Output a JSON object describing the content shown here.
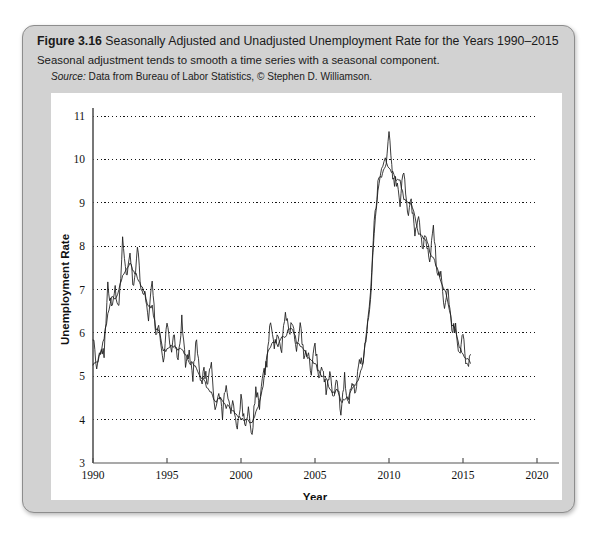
{
  "figure": {
    "label": "Figure 3.16",
    "title": "Seasonally Adjusted and Unadjusted Unemployment Rate for the Years 1990–2015",
    "subtitle": "Seasonal adjustment tends to smooth a time series with a seasonal component.",
    "source_label": "Source:",
    "source_text": "Data from Bureau of Labor Statistics, © Stephen D. Williamson."
  },
  "chart_data": {
    "type": "line",
    "title": "",
    "xlabel": "Year",
    "ylabel": "Unemployment Rate",
    "xlim": [
      1990,
      2020
    ],
    "ylim": [
      3,
      11
    ],
    "xticks": [
      1990,
      1995,
      2000,
      2005,
      2010,
      2015,
      2020
    ],
    "yticks": [
      3,
      4,
      5,
      6,
      7,
      8,
      9,
      10,
      11
    ],
    "grid": "horizontal-dotted",
    "legend": "none",
    "line_color": "#1a1a1a",
    "series": [
      {
        "name": "Seasonally Adjusted",
        "style": "smooth",
        "x": [
          1990.0,
          1990.25,
          1990.5,
          1990.75,
          1991.0,
          1991.25,
          1991.5,
          1991.75,
          1992.0,
          1992.25,
          1992.5,
          1992.75,
          1993.0,
          1993.25,
          1993.5,
          1993.75,
          1994.0,
          1994.25,
          1994.5,
          1994.75,
          1995.0,
          1995.25,
          1995.5,
          1995.75,
          1996.0,
          1996.25,
          1996.5,
          1996.75,
          1997.0,
          1997.25,
          1997.5,
          1997.75,
          1998.0,
          1998.25,
          1998.5,
          1998.75,
          1999.0,
          1999.25,
          1999.5,
          1999.75,
          2000.0,
          2000.25,
          2000.5,
          2000.75,
          2001.0,
          2001.25,
          2001.5,
          2001.75,
          2002.0,
          2002.25,
          2002.5,
          2002.75,
          2003.0,
          2003.25,
          2003.5,
          2003.75,
          2004.0,
          2004.25,
          2004.5,
          2004.75,
          2005.0,
          2005.25,
          2005.5,
          2005.75,
          2006.0,
          2006.25,
          2006.5,
          2006.75,
          2007.0,
          2007.25,
          2007.5,
          2007.75,
          2008.0,
          2008.25,
          2008.5,
          2008.75,
          2009.0,
          2009.25,
          2009.5,
          2009.75,
          2010.0,
          2010.25,
          2010.5,
          2010.75,
          2011.0,
          2011.25,
          2011.5,
          2011.75,
          2012.0,
          2012.25,
          2012.5,
          2012.75,
          2013.0,
          2013.25,
          2013.5,
          2013.75,
          2014.0,
          2014.25,
          2014.5,
          2014.75,
          2015.0,
          2015.25,
          2015.5
        ],
        "y": [
          5.3,
          5.3,
          5.5,
          5.9,
          6.4,
          6.8,
          6.8,
          7.0,
          7.3,
          7.5,
          7.6,
          7.4,
          7.3,
          7.1,
          6.9,
          6.6,
          6.6,
          6.1,
          6.0,
          5.6,
          5.6,
          5.7,
          5.7,
          5.6,
          5.6,
          5.5,
          5.3,
          5.3,
          5.2,
          5.0,
          4.9,
          4.7,
          4.6,
          4.4,
          4.5,
          4.4,
          4.3,
          4.3,
          4.2,
          4.1,
          4.0,
          4.0,
          4.0,
          3.9,
          4.2,
          4.4,
          4.8,
          5.5,
          5.7,
          5.8,
          5.7,
          5.9,
          5.9,
          6.1,
          6.1,
          5.8,
          5.7,
          5.6,
          5.4,
          5.4,
          5.3,
          5.1,
          5.0,
          5.0,
          4.7,
          4.6,
          4.7,
          4.4,
          4.5,
          4.5,
          4.7,
          4.8,
          5.0,
          5.3,
          6.1,
          6.9,
          8.3,
          9.3,
          9.8,
          10.0,
          9.8,
          9.7,
          9.5,
          9.5,
          9.1,
          9.0,
          9.0,
          8.7,
          8.3,
          8.2,
          8.2,
          7.9,
          7.7,
          7.5,
          7.2,
          7.0,
          6.7,
          6.2,
          6.1,
          5.7,
          5.5,
          5.4,
          5.3
        ]
      },
      {
        "name": "Unadjusted",
        "style": "jagged-seasonal",
        "x": [
          1990.0,
          1990.25,
          1990.5,
          1990.75,
          1991.0,
          1991.25,
          1991.5,
          1991.75,
          1992.0,
          1992.25,
          1992.5,
          1992.75,
          1993.0,
          1993.25,
          1993.5,
          1993.75,
          1994.0,
          1994.25,
          1994.5,
          1994.75,
          1995.0,
          1995.25,
          1995.5,
          1995.75,
          1996.0,
          1996.25,
          1996.5,
          1996.75,
          1997.0,
          1997.25,
          1997.5,
          1997.75,
          1998.0,
          1998.25,
          1998.5,
          1998.75,
          1999.0,
          1999.25,
          1999.5,
          1999.75,
          2000.0,
          2000.25,
          2000.5,
          2000.75,
          2001.0,
          2001.25,
          2001.5,
          2001.75,
          2002.0,
          2002.25,
          2002.5,
          2002.75,
          2003.0,
          2003.25,
          2003.5,
          2003.75,
          2004.0,
          2004.25,
          2004.5,
          2004.75,
          2005.0,
          2005.25,
          2005.5,
          2005.75,
          2006.0,
          2006.25,
          2006.5,
          2006.75,
          2007.0,
          2007.25,
          2007.5,
          2007.75,
          2008.0,
          2008.25,
          2008.5,
          2008.75,
          2009.0,
          2009.25,
          2009.5,
          2009.75,
          2010.0,
          2010.25,
          2010.5,
          2010.75,
          2011.0,
          2011.25,
          2011.5,
          2011.75,
          2012.0,
          2012.25,
          2012.5,
          2012.75,
          2013.0,
          2013.25,
          2013.5,
          2013.75,
          2014.0,
          2014.25,
          2014.5,
          2014.75,
          2015.0,
          2015.25,
          2015.5
        ],
        "y": [
          5.9,
          5.2,
          5.6,
          5.5,
          7.1,
          6.6,
          7.0,
          6.6,
          8.1,
          7.3,
          7.8,
          7.0,
          8.0,
          6.9,
          7.0,
          6.2,
          7.3,
          5.9,
          6.1,
          5.3,
          6.3,
          5.6,
          5.9,
          5.3,
          6.3,
          5.3,
          5.5,
          5.0,
          5.9,
          4.8,
          5.1,
          4.9,
          5.2,
          4.3,
          4.7,
          4.1,
          4.9,
          4.2,
          4.4,
          3.8,
          4.5,
          3.9,
          4.2,
          3.7,
          4.7,
          4.3,
          5.0,
          5.3,
          6.3,
          5.7,
          6.0,
          5.6,
          6.5,
          6.0,
          6.3,
          5.5,
          6.3,
          5.4,
          5.6,
          5.1,
          5.8,
          5.0,
          5.2,
          4.7,
          5.1,
          4.5,
          4.9,
          4.2,
          5.0,
          4.3,
          4.9,
          4.6,
          5.4,
          5.2,
          6.1,
          6.7,
          8.5,
          9.4,
          9.7,
          9.7,
          10.6,
          9.5,
          9.5,
          9.0,
          9.8,
          8.7,
          9.1,
          8.2,
          8.8,
          7.9,
          8.2,
          7.6,
          8.5,
          7.3,
          7.3,
          6.6,
          7.0,
          6.1,
          6.1,
          5.5,
          6.0,
          5.2,
          5.5
        ]
      }
    ]
  }
}
